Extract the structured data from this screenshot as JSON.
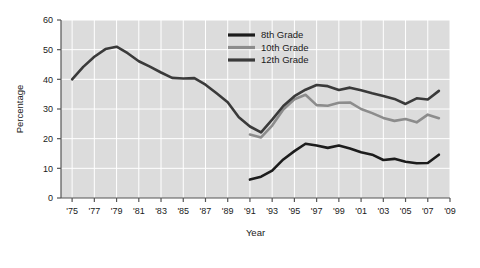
{
  "chart_data": {
    "type": "line",
    "title": "",
    "xlabel": "Year",
    "ylabel": "Percentage",
    "xlim": [
      1974,
      2009
    ],
    "ylim": [
      0,
      60
    ],
    "grid": true,
    "legend_position": "top-center",
    "x_tick_labels": [
      "'75",
      "'77",
      "'79",
      "'81",
      "'83",
      "'85",
      "'87",
      "'89",
      "'91",
      "'93",
      "'95",
      "'97",
      "'99",
      "'01",
      "'03",
      "'05",
      "'07",
      "'09"
    ],
    "x_tick_values": [
      1975,
      1977,
      1979,
      1981,
      1983,
      1985,
      1987,
      1989,
      1991,
      1993,
      1995,
      1997,
      1999,
      2001,
      2003,
      2005,
      2007,
      2009
    ],
    "y_tick_labels": [
      "0",
      "10",
      "20",
      "30",
      "40",
      "50",
      "60"
    ],
    "y_tick_values": [
      0,
      10,
      20,
      30,
      40,
      50,
      60
    ],
    "series": [
      {
        "name": "8th Grade",
        "color": "#1c1c1c",
        "width": 2.6,
        "x": [
          1991,
          1992,
          1993,
          1994,
          1995,
          1996,
          1997,
          1998,
          1999,
          2000,
          2001,
          2002,
          2003,
          2004,
          2005,
          2006,
          2007,
          2008
        ],
        "values": [
          6.2,
          7.2,
          9.2,
          13.0,
          15.8,
          18.3,
          17.7,
          16.9,
          17.7,
          16.7,
          15.4,
          14.6,
          12.8,
          13.2,
          12.2,
          11.7,
          11.8,
          14.6
        ]
      },
      {
        "name": "10th Grade",
        "color": "#8c8c8c",
        "width": 2.6,
        "x": [
          1991,
          1992,
          1993,
          1994,
          1995,
          1996,
          1997,
          1998,
          1999,
          2000,
          2001,
          2002,
          2003,
          2004,
          2005,
          2006,
          2007,
          2008
        ],
        "values": [
          21.4,
          20.4,
          24.4,
          29.8,
          33.3,
          34.8,
          31.3,
          31.1,
          32.1,
          32.2,
          30.0,
          28.6,
          27.0,
          26.0,
          26.6,
          25.5,
          28.1,
          26.9
        ]
      },
      {
        "name": "12th Grade",
        "color": "#3a3a3a",
        "width": 2.6,
        "x": [
          1975,
          1976,
          1977,
          1978,
          1979,
          1980,
          1981,
          1982,
          1983,
          1984,
          1985,
          1986,
          1987,
          1988,
          1989,
          1990,
          1991,
          1992,
          1993,
          1994,
          1995,
          1996,
          1997,
          1998,
          1999,
          2000,
          2001,
          2002,
          2003,
          2004,
          2005,
          2006,
          2007,
          2008
        ],
        "values": [
          40.0,
          44.2,
          47.6,
          50.2,
          51.0,
          48.8,
          46.1,
          44.3,
          42.3,
          40.5,
          40.3,
          40.4,
          38.2,
          35.3,
          32.3,
          27.2,
          24.1,
          22.1,
          26.4,
          31.0,
          34.3,
          36.5,
          38.1,
          37.7,
          36.4,
          37.2,
          36.3,
          35.3,
          34.4,
          33.4,
          31.7,
          33.6,
          33.2,
          36.1
        ]
      }
    ],
    "legend": [
      {
        "label": "8th Grade",
        "color": "#1c1c1c"
      },
      {
        "label": "10th Grade",
        "color": "#8c8c8c"
      },
      {
        "label": "12th Grade",
        "color": "#3a3a3a"
      }
    ]
  },
  "style": {
    "plot_background": "#dcdcdc",
    "gridline_color": "#ffffff",
    "axis_color": "#555555",
    "text_color": "#1a1a1a"
  }
}
